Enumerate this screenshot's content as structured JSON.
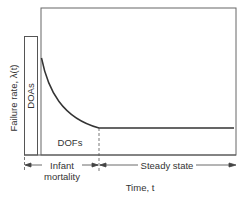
{
  "diagram": {
    "y_axis_label": "Failure rate, λ(t)",
    "x_axis_label": "Time, t",
    "regions": {
      "doa": "DOAs",
      "dof": "DOFs",
      "infant_line1": "Infant",
      "infant_line2": "mortality",
      "steady": "Steady state"
    },
    "colors": {
      "line": "#333333",
      "frame": "#666666",
      "text": "#333333"
    }
  }
}
